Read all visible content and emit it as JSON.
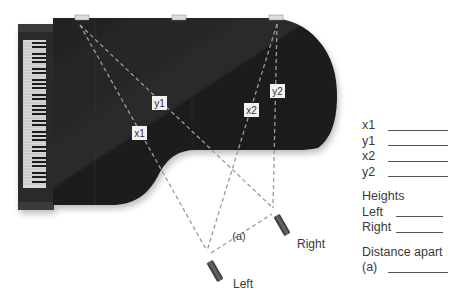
{
  "diagram": {
    "colors": {
      "piano_body": "#1e1e1e",
      "piano_highlight": "#2c2c2c",
      "dashed_line": "#9a9a9a",
      "label_box": "#f2f2f2",
      "mic": "#4a4a4a"
    },
    "distance_labels": {
      "x1": "x1",
      "y1": "y1",
      "x2": "x2",
      "y2": "y2",
      "a": "(a)"
    },
    "microphones": {
      "left": "Left",
      "right": "Right"
    }
  },
  "form": {
    "distances": [
      {
        "label": "x1",
        "value": ""
      },
      {
        "label": "y1",
        "value": ""
      },
      {
        "label": "x2",
        "value": ""
      },
      {
        "label": "y2",
        "value": ""
      }
    ],
    "heights_heading": "Heights",
    "heights": [
      {
        "label": "Left",
        "value": ""
      },
      {
        "label": "Right",
        "value": ""
      }
    ],
    "distance_apart_heading": "Distance apart",
    "distance_apart": {
      "label": "(a)",
      "value": ""
    }
  }
}
